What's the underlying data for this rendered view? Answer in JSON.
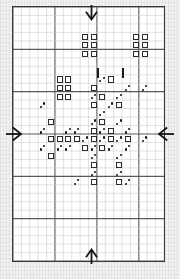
{
  "chart": {
    "grid": {
      "columns": 18,
      "rows": 30,
      "cell_size_px": 8.5,
      "minor_line_color": "#c9c9c9",
      "major_line_color": "#5a5a5a",
      "major_every": 5,
      "border_color": "#3a3a3a",
      "background": "#ffffff",
      "grid_shown": true
    },
    "legend_symbols": [
      {
        "id": "square",
        "name": "open-square-symbol",
        "label": "open square",
        "color": "#2b2b2b"
      },
      {
        "id": "dots",
        "name": "double-dot-symbol",
        "label": "diagonal dot pair",
        "color": "#111111"
      }
    ],
    "center_markers": {
      "top": {
        "name": "center-arrow-down",
        "direction": "down",
        "col": 9
      },
      "bottom": {
        "name": "center-arrow-up",
        "direction": "up",
        "col": 9
      },
      "left": {
        "name": "center-arrow-right",
        "direction": "right",
        "row": 15
      },
      "right": {
        "name": "center-arrow-left",
        "direction": "left",
        "row": 15
      }
    },
    "tick_marks": [
      {
        "name": "column-tick-left",
        "col": 10,
        "row": 7
      },
      {
        "name": "column-tick-right",
        "col": 13,
        "row": 7
      }
    ],
    "stitches": [
      {
        "s": "square",
        "c": 8,
        "r": 3
      },
      {
        "s": "square",
        "c": 9,
        "r": 3
      },
      {
        "s": "square",
        "c": 14,
        "r": 3
      },
      {
        "s": "square",
        "c": 15,
        "r": 3
      },
      {
        "s": "square",
        "c": 8,
        "r": 4
      },
      {
        "s": "square",
        "c": 9,
        "r": 4
      },
      {
        "s": "square",
        "c": 14,
        "r": 4
      },
      {
        "s": "square",
        "c": 15,
        "r": 4
      },
      {
        "s": "square",
        "c": 8,
        "r": 5
      },
      {
        "s": "square",
        "c": 9,
        "r": 5
      },
      {
        "s": "square",
        "c": 14,
        "r": 5
      },
      {
        "s": "square",
        "c": 15,
        "r": 5
      },
      {
        "s": "square",
        "c": 5,
        "r": 8
      },
      {
        "s": "square",
        "c": 6,
        "r": 8
      },
      {
        "s": "dots",
        "c": 10,
        "r": 8
      },
      {
        "s": "square",
        "c": 11,
        "r": 8
      },
      {
        "s": "square",
        "c": 5,
        "r": 9
      },
      {
        "s": "square",
        "c": 6,
        "r": 9
      },
      {
        "s": "square",
        "c": 9,
        "r": 9
      },
      {
        "s": "dots",
        "c": 13,
        "r": 9
      },
      {
        "s": "dots",
        "c": 15,
        "r": 9
      },
      {
        "s": "square",
        "c": 5,
        "r": 10
      },
      {
        "s": "square",
        "c": 6,
        "r": 10
      },
      {
        "s": "dots",
        "c": 9,
        "r": 10
      },
      {
        "s": "square",
        "c": 10,
        "r": 10
      },
      {
        "s": "dots",
        "c": 12,
        "r": 10
      },
      {
        "s": "dots",
        "c": 3,
        "r": 11
      },
      {
        "s": "square",
        "c": 9,
        "r": 11
      },
      {
        "s": "dots",
        "c": 11,
        "r": 11
      },
      {
        "s": "square",
        "c": 12,
        "r": 11
      },
      {
        "s": "dots",
        "c": 10,
        "r": 12
      },
      {
        "s": "square",
        "c": 4,
        "r": 13
      },
      {
        "s": "dots",
        "c": 9,
        "r": 13
      },
      {
        "s": "square",
        "c": 10,
        "r": 13
      },
      {
        "s": "dots",
        "c": 12,
        "r": 13
      },
      {
        "s": "dots",
        "c": 3,
        "r": 14
      },
      {
        "s": "dots",
        "c": 6,
        "r": 14
      },
      {
        "s": "dots",
        "c": 7,
        "r": 14
      },
      {
        "s": "square",
        "c": 9,
        "r": 14
      },
      {
        "s": "dots",
        "c": 10,
        "r": 14
      },
      {
        "s": "square",
        "c": 11,
        "r": 14
      },
      {
        "s": "dots",
        "c": 13,
        "r": 14
      },
      {
        "s": "square",
        "c": 4,
        "r": 15
      },
      {
        "s": "square",
        "c": 5,
        "r": 15
      },
      {
        "s": "square",
        "c": 6,
        "r": 15
      },
      {
        "s": "square",
        "c": 7,
        "r": 15
      },
      {
        "s": "dots",
        "c": 8,
        "r": 15
      },
      {
        "s": "square",
        "c": 9,
        "r": 15
      },
      {
        "s": "dots",
        "c": 10,
        "r": 15
      },
      {
        "s": "square",
        "c": 11,
        "r": 15
      },
      {
        "s": "dots",
        "c": 12,
        "r": 15
      },
      {
        "s": "square",
        "c": 13,
        "r": 15
      },
      {
        "s": "dots",
        "c": 15,
        "r": 15
      },
      {
        "s": "dots",
        "c": 3,
        "r": 16
      },
      {
        "s": "dots",
        "c": 5,
        "r": 16
      },
      {
        "s": "dots",
        "c": 6,
        "r": 16
      },
      {
        "s": "square",
        "c": 8,
        "r": 16
      },
      {
        "s": "dots",
        "c": 9,
        "r": 16
      },
      {
        "s": "square",
        "c": 10,
        "r": 16
      },
      {
        "s": "dots",
        "c": 11,
        "r": 16
      },
      {
        "s": "dots",
        "c": 13,
        "r": 16
      },
      {
        "s": "square",
        "c": 4,
        "r": 17
      },
      {
        "s": "dots",
        "c": 9,
        "r": 17
      },
      {
        "s": "dots",
        "c": 12,
        "r": 17
      },
      {
        "s": "square",
        "c": 9,
        "r": 18
      },
      {
        "s": "square",
        "c": 12,
        "r": 18
      },
      {
        "s": "dots",
        "c": 9,
        "r": 19
      },
      {
        "s": "dots",
        "c": 12,
        "r": 19
      },
      {
        "s": "dots",
        "c": 7,
        "r": 20
      },
      {
        "s": "square",
        "c": 9,
        "r": 20
      },
      {
        "s": "square",
        "c": 12,
        "r": 20
      },
      {
        "s": "dots",
        "c": 13,
        "r": 20
      }
    ]
  }
}
